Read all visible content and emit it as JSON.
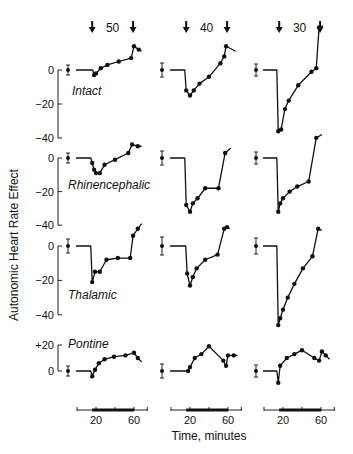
{
  "chart_data": {
    "type": "line",
    "title": "",
    "ylabel": "Autonomic Heart Rate Effect",
    "xlabel": "Time, minutes",
    "columns": [
      {
        "header": "50",
        "x_ticks": [
          20,
          60
        ]
      },
      {
        "header": "40",
        "x_ticks": [
          20,
          60
        ]
      },
      {
        "header": "30",
        "x_ticks": [
          20,
          60
        ]
      }
    ],
    "rows": [
      {
        "label": "Intact",
        "yticks": [
          "0",
          "−20",
          "−40"
        ],
        "ylim": [
          -40,
          15
        ]
      },
      {
        "label": "Rhinencephalic",
        "yticks": [
          "0",
          "−20",
          "−40"
        ],
        "ylim": [
          -40,
          15
        ]
      },
      {
        "label": "Thalamic",
        "yticks": [
          "0",
          "−20",
          "−40"
        ],
        "ylim": [
          -40,
          15
        ]
      },
      {
        "label": "Pontine",
        "yticks": [
          "+20",
          "0"
        ],
        "ylim": [
          -10,
          20
        ]
      }
    ],
    "stimulus_window_minutes": [
      16,
      60
    ],
    "series": [
      {
        "row": "Intact",
        "column": "50",
        "baseline": 0,
        "points": [
          [
            18,
            -3
          ],
          [
            20,
            -2
          ],
          [
            25,
            1
          ],
          [
            32,
            3
          ],
          [
            44,
            5
          ],
          [
            57,
            7
          ],
          [
            60,
            14
          ],
          [
            65,
            12
          ]
        ],
        "end": [
          68,
          11
        ]
      },
      {
        "row": "Intact",
        "column": "40",
        "baseline": 0,
        "points": [
          [
            16,
            -12
          ],
          [
            20,
            -15
          ],
          [
            24,
            -12
          ],
          [
            30,
            -8
          ],
          [
            40,
            -4
          ],
          [
            52,
            4
          ],
          [
            56,
            8
          ],
          [
            58,
            14
          ]
        ],
        "end": [
          68,
          11
        ]
      },
      {
        "row": "Intact",
        "column": "30",
        "baseline": 0,
        "points": [
          [
            15,
            -36
          ],
          [
            18,
            -35
          ],
          [
            22,
            -23
          ],
          [
            26,
            -18
          ],
          [
            36,
            -9
          ],
          [
            50,
            -1
          ],
          [
            55,
            1
          ],
          [
            58,
            25
          ]
        ],
        "end": [
          62,
          26
        ]
      },
      {
        "row": "Rhinencephalic",
        "column": "50",
        "baseline": 0,
        "points": [
          [
            16,
            -3
          ],
          [
            18,
            -7
          ],
          [
            20,
            -9
          ],
          [
            24,
            -9
          ],
          [
            29,
            -4
          ],
          [
            40,
            -1
          ],
          [
            54,
            3
          ],
          [
            58,
            8
          ],
          [
            64,
            7
          ]
        ],
        "end": [
          68,
          7
        ]
      },
      {
        "row": "Rhinencephalic",
        "column": "40",
        "baseline": 0,
        "points": [
          [
            16,
            -28
          ],
          [
            20,
            -32
          ],
          [
            23,
            -27
          ],
          [
            28,
            -24
          ],
          [
            36,
            -18
          ],
          [
            50,
            -18
          ],
          [
            57,
            3
          ]
        ],
        "end": [
          63,
          6
        ]
      },
      {
        "row": "Rhinencephalic",
        "column": "30",
        "baseline": 0,
        "points": [
          [
            15,
            -32
          ],
          [
            17,
            -27
          ],
          [
            20,
            -24
          ],
          [
            27,
            -20
          ],
          [
            35,
            -17
          ],
          [
            47,
            -14
          ],
          [
            55,
            12
          ]
        ],
        "end": [
          61,
          14
        ]
      },
      {
        "row": "Thalamic",
        "column": "50",
        "baseline": 0,
        "points": [
          [
            16,
            -21
          ],
          [
            19,
            -15
          ],
          [
            24,
            -15
          ],
          [
            31,
            -8
          ],
          [
            43,
            -7
          ],
          [
            56,
            -7
          ],
          [
            59,
            6
          ],
          [
            64,
            10
          ]
        ],
        "end": [
          68,
          13
        ]
      },
      {
        "row": "Thalamic",
        "column": "40",
        "baseline": 0,
        "points": [
          [
            17,
            -16
          ],
          [
            20,
            -23
          ],
          [
            23,
            -18
          ],
          [
            27,
            -13
          ],
          [
            36,
            -8
          ],
          [
            49,
            -5
          ],
          [
            56,
            10
          ],
          [
            59,
            11
          ]
        ],
        "end": [
          62,
          10
        ]
      },
      {
        "row": "Thalamic",
        "column": "30",
        "baseline": 0,
        "points": [
          [
            15,
            -46
          ],
          [
            17,
            -42
          ],
          [
            20,
            -37
          ],
          [
            25,
            -30
          ],
          [
            32,
            -22
          ],
          [
            41,
            -13
          ],
          [
            51,
            -6
          ],
          [
            57,
            10
          ]
        ],
        "end": [
          61,
          9
        ]
      },
      {
        "row": "Pontine",
        "column": "50",
        "baseline": 0,
        "points": [
          [
            16,
            -4
          ],
          [
            19,
            1
          ],
          [
            23,
            6
          ],
          [
            29,
            9
          ],
          [
            39,
            11
          ],
          [
            51,
            12
          ],
          [
            60,
            14
          ],
          [
            64,
            10
          ]
        ],
        "end": [
          68,
          7
        ]
      },
      {
        "row": "Pontine",
        "column": "40",
        "baseline": 0,
        "points": [
          [
            18,
            0
          ],
          [
            20,
            3
          ],
          [
            25,
            10
          ],
          [
            32,
            13
          ],
          [
            40,
            19
          ],
          [
            55,
            8
          ],
          [
            58,
            4
          ],
          [
            60,
            12
          ],
          [
            66,
            12
          ]
        ],
        "end": [
          70,
          12
        ]
      },
      {
        "row": "Pontine",
        "column": "30",
        "baseline": 0,
        "points": [
          [
            15,
            -9
          ],
          [
            17,
            4
          ],
          [
            24,
            10
          ],
          [
            32,
            13
          ],
          [
            40,
            16
          ],
          [
            53,
            10
          ],
          [
            58,
            8
          ],
          [
            61,
            15
          ],
          [
            65,
            12
          ]
        ],
        "end": [
          69,
          9
        ]
      }
    ]
  }
}
